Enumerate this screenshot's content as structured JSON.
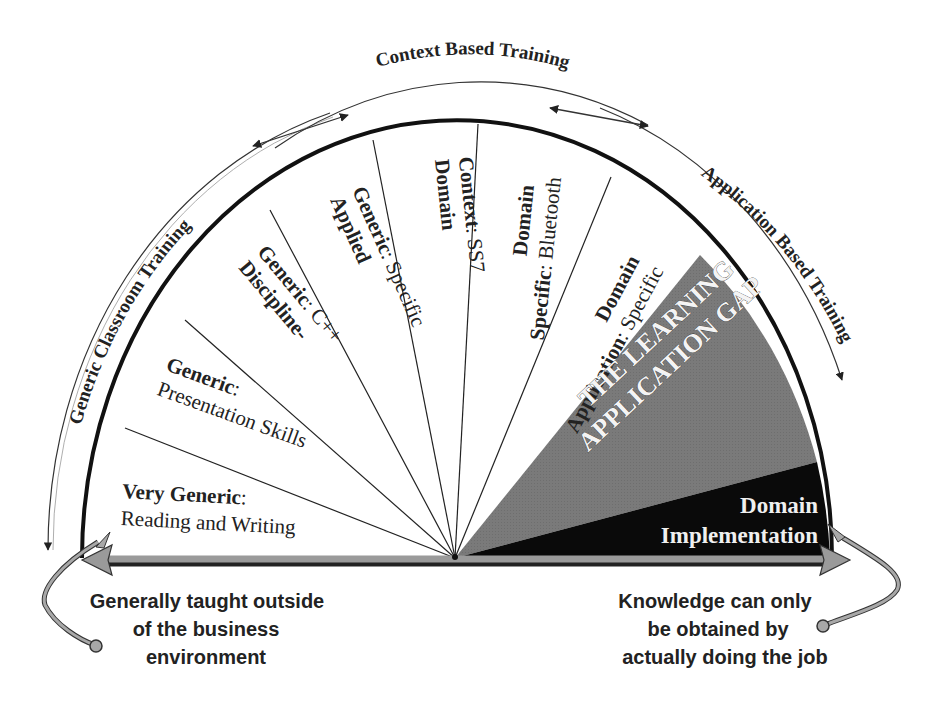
{
  "diagram": {
    "arc_titles": {
      "left": "Generic Classroom Training",
      "top": "Context Based Training",
      "right": "Application Based Training"
    },
    "segments": [
      {
        "id": "very-generic",
        "bold": "Very Generic",
        "rest": "Reading and Writing",
        "sep": ":"
      },
      {
        "id": "generic",
        "bold": "Generic",
        "rest": "Presentation Skills",
        "sep": ":"
      },
      {
        "id": "discipline-generic",
        "bold_line1": "Discipline-",
        "bold_line2": "Generic",
        "rest": "C++",
        "sep": ":"
      },
      {
        "id": "applied-generic",
        "bold_line1": "Applied",
        "bold_line2": "Generic",
        "rest": "Specific",
        "sep": ":"
      },
      {
        "id": "domain-context",
        "bold_line1": "Domain",
        "bold_line2": "Context",
        "rest": "SS7",
        "sep": ":"
      },
      {
        "id": "domain-specific",
        "bold_line1": "Domain",
        "bold_line2": "Specific",
        "rest": "Bluetooth",
        "sep": ":"
      },
      {
        "id": "domain-application",
        "bold_line1": "Domain",
        "bold_line2": "Application",
        "rest": "Specific",
        "sep": ":"
      }
    ],
    "gap": {
      "line1": "THE LEARNING",
      "line2": "APPLICATION GAP",
      "fill": "#7a7a7a"
    },
    "implementation": {
      "line1": "Domain",
      "line2": "Implementation",
      "fill": "#0a0a0a"
    },
    "notes": {
      "left": [
        "Generally taught outside",
        "of the business",
        "environment"
      ],
      "right": [
        "Knowledge can only",
        "be obtained by",
        "actually doing the job"
      ]
    },
    "colors": {
      "outline": "#111111",
      "arrow_gray": "#9a9a9a",
      "text": "#222222"
    }
  }
}
